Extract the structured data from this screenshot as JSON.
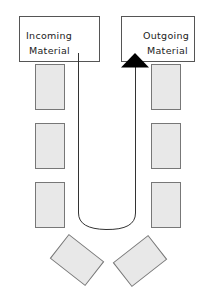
{
  "diagram": {
    "incoming": {
      "line1": "Incoming",
      "line2": "Material"
    },
    "outgoing": {
      "line1": "Outgoing",
      "line2": "Material"
    },
    "colors": {
      "stroke": "#555555",
      "station_fill": "#e8e8e8",
      "arrow": "#000000"
    },
    "station_count": 8
  }
}
